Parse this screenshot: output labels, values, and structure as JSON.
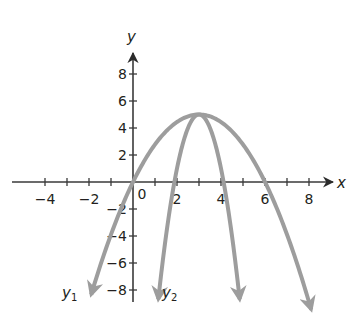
{
  "chart_data": {
    "type": "line",
    "title": "",
    "xlabel": "x",
    "ylabel": "y",
    "xlim": [
      -4.5,
      9
    ],
    "ylim": [
      -8.6,
      9.5
    ],
    "grid": false,
    "x_ticks": [
      -4,
      -3,
      -2,
      -1,
      0,
      1,
      2,
      3,
      4,
      5,
      6,
      7,
      8
    ],
    "x_tick_labels": [
      {
        "value": -4,
        "label": "−4"
      },
      {
        "value": -2,
        "label": "−2"
      },
      {
        "value": 0,
        "label": "0"
      },
      {
        "value": 2,
        "label": "2"
      },
      {
        "value": 4,
        "label": "4"
      },
      {
        "value": 6,
        "label": "6"
      },
      {
        "value": 8,
        "label": "8"
      }
    ],
    "y_tick_labels": [
      {
        "value": 8,
        "label": "8"
      },
      {
        "value": 6,
        "label": "6"
      },
      {
        "value": 4,
        "label": "4"
      },
      {
        "value": 2,
        "label": "2"
      },
      {
        "value": -2,
        "label": "−2"
      },
      {
        "value": -4,
        "label": "−4"
      },
      {
        "value": -6,
        "label": "−6"
      },
      {
        "value": -8,
        "label": "−8"
      }
    ],
    "series": [
      {
        "name": "y1",
        "label_main": "y",
        "label_sub": "1",
        "kind": "parabola",
        "vertex": [
          3,
          5
        ],
        "a": -0.5556,
        "x_intercepts": [
          0,
          6
        ],
        "x_range": [
          -1.9,
          8.1
        ],
        "arrows_both_ends": true,
        "color": "#9d9d9d"
      },
      {
        "name": "y2",
        "label_main": "y",
        "label_sub": "2",
        "kind": "parabola",
        "vertex": [
          3,
          5
        ],
        "a": -4.0,
        "x_intercepts": [
          1.9,
          4.1
        ],
        "x_range": [
          1.15,
          4.85
        ],
        "arrows_both_ends": true,
        "color": "#9d9d9d"
      }
    ],
    "legend": "inline labels near lower-left arrowheads",
    "axis_color": "#3a3a3a"
  }
}
